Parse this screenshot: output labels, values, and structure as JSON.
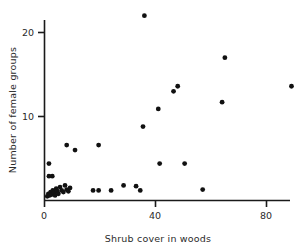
{
  "chart_data": {
    "type": "scatter",
    "title": "",
    "subtitle": "",
    "xlabel": "Shrub cover in woods",
    "ylabel": "Number of female groups",
    "xlim": [
      0,
      95
    ],
    "ylim": [
      0,
      23
    ],
    "xticks": [
      0,
      40,
      80
    ],
    "xticklabels": [
      "0",
      "40",
      "80"
    ],
    "yticks": [
      10,
      20
    ],
    "yticklabels": [
      "10",
      "20"
    ],
    "grid": false,
    "legend": false,
    "legend_position": "none",
    "marker": "filled-circle",
    "marker_color": "#111111",
    "marker_size_px": 4.6,
    "axis_color": "#1a1a1a",
    "background_color": "#ffffff",
    "series": [
      {
        "name": "observations",
        "points": [
          [
            1.0,
            0.5
          ],
          [
            1.4,
            0.8
          ],
          [
            1.8,
            0.6
          ],
          [
            2.2,
            1.0
          ],
          [
            2.6,
            0.7
          ],
          [
            3.0,
            1.2
          ],
          [
            3.4,
            0.9
          ],
          [
            3.8,
            0.6
          ],
          [
            4.2,
            1.4
          ],
          [
            4.6,
            1.1
          ],
          [
            5.0,
            0.8
          ],
          [
            5.6,
            1.6
          ],
          [
            6.2,
            1.2
          ],
          [
            6.8,
            1.0
          ],
          [
            7.4,
            1.8
          ],
          [
            8.0,
            1.3
          ],
          [
            8.6,
            1.1
          ],
          [
            9.2,
            1.5
          ],
          [
            1.6,
            4.4
          ],
          [
            1.6,
            2.9
          ],
          [
            2.8,
            2.9
          ],
          [
            8.0,
            6.6
          ],
          [
            11.0,
            6.0
          ],
          [
            19.5,
            6.6
          ],
          [
            17.5,
            1.2
          ],
          [
            19.5,
            1.2
          ],
          [
            24.0,
            1.2
          ],
          [
            28.5,
            1.8
          ],
          [
            33.0,
            1.7
          ],
          [
            34.5,
            1.2
          ],
          [
            36.0,
            22.0
          ],
          [
            35.5,
            8.8
          ],
          [
            41.0,
            10.9
          ],
          [
            46.5,
            13.0
          ],
          [
            48.0,
            13.6
          ],
          [
            41.5,
            4.4
          ],
          [
            50.5,
            4.4
          ],
          [
            57.0,
            1.3
          ],
          [
            64.0,
            11.7
          ],
          [
            65.0,
            17.0
          ],
          [
            89.0,
            13.6
          ]
        ]
      }
    ]
  },
  "axes": {
    "x_title": "Shrub cover in woods",
    "y_title": "Number of female groups",
    "x_tick_0": "0",
    "x_tick_40": "40",
    "x_tick_80": "80",
    "y_tick_10": "10",
    "y_tick_20": "20"
  }
}
